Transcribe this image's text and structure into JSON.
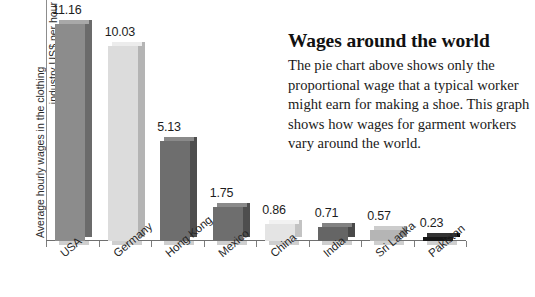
{
  "chart_data": {
    "type": "bar",
    "title": "",
    "xlabel": "",
    "ylabel": "Average hourly wages in the clothing industry US$ per hour",
    "ylabel_line1": "Average hourly wages in the clothing",
    "ylabel_line2": "industry US$ per hour",
    "ylim": [
      0,
      12.4
    ],
    "grid": false,
    "legend": "none",
    "categories": [
      "USA",
      "Germany",
      "Hong Kong",
      "Mexico",
      "China",
      "India",
      "Sri Lanka",
      "Pakistan"
    ],
    "values": [
      11.16,
      10.03,
      5.13,
      1.75,
      0.86,
      0.71,
      0.57,
      0.23
    ],
    "value_labels": [
      "11.16",
      "10.03",
      "5.13",
      "1.75",
      "0.86",
      "0.71",
      "0.57",
      "0.23"
    ],
    "bar_colors": [
      "#8c8c8c",
      "#dcdcdc",
      "#6e6e6e",
      "#6e6e6e",
      "#e4e4e4",
      "#656565",
      "#b5b5b5",
      "#161616"
    ],
    "bar_side_colors": [
      "#6b6b6b",
      "#b4b4b4",
      "#4e4e4e",
      "#4e4e4e",
      "#c3c3c3",
      "#494949",
      "#8f8f8f",
      "#000000"
    ],
    "bar_top_colors": [
      "#a8a8a8",
      "#ececec",
      "#8a8a8a",
      "#8a8a8a",
      "#f2f2f2",
      "#828282",
      "#cccccc",
      "#333333"
    ]
  },
  "panel": {
    "title": "Wages around the world",
    "body": "The pie chart above shows only the proportional wage that a typical worker might earn for making a shoe. This graph shows how wages for garment workers vary around the world."
  }
}
